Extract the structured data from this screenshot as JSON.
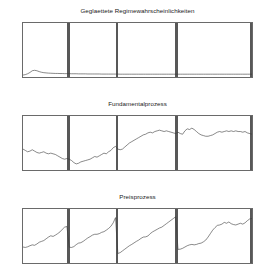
{
  "figure": {
    "background": "#ffffff",
    "line_color": "#3a3a3a",
    "axis_color": "#6a6a6a",
    "regime_bar_color": "#585858"
  },
  "panels": [
    {
      "name": "smoothed-regime-probabilities",
      "title": "Geglaettete Regimewahrscheinlichkeiten"
    },
    {
      "name": "fundamental-process",
      "title": "Fundamentalprozess"
    },
    {
      "name": "price-process",
      "title": "Preisprozess"
    }
  ],
  "chart_data": [
    {
      "type": "line",
      "title": "Geglaettete Regimewahrscheinlichkeiten",
      "xlabel": "",
      "ylabel": "",
      "xlim": [
        1,
        100
      ],
      "ylim": [
        0,
        0.5
      ],
      "grid": false,
      "legend": "none",
      "xticks": [
        5,
        10,
        15,
        20,
        25,
        30,
        35,
        40,
        45,
        50,
        55,
        60,
        65,
        70,
        75,
        80,
        85,
        90,
        95,
        100
      ],
      "xticklabels": [
        "5",
        "10",
        "15",
        "20",
        "25",
        "30",
        "35",
        "40",
        "45",
        "50",
        "55",
        "60",
        "65",
        "70",
        "75",
        "80",
        "85",
        "90",
        "95",
        "100"
      ],
      "yticks": [
        0,
        0.1,
        0.2,
        0.3,
        0.4,
        0.5
      ],
      "yticklabels": [
        "0",
        ".1",
        ".2",
        ".3",
        ".4",
        ".5"
      ],
      "annotations": [
        {
          "type": "vspan",
          "x0": 20.0,
          "x1": 21.2
        },
        {
          "type": "vspan",
          "x0": 41.0,
          "x1": 42.2
        },
        {
          "type": "vspan",
          "x0": 66.8,
          "x1": 68.0
        },
        {
          "type": "vspan",
          "x0": 99.0,
          "x1": 100.0
        }
      ],
      "x": [
        1,
        2,
        3,
        4,
        5,
        6,
        7,
        8,
        9,
        10,
        11,
        12,
        13,
        14,
        15,
        16,
        17,
        18,
        19,
        20,
        21,
        22,
        23,
        24,
        25,
        26,
        27,
        28,
        29,
        30,
        31,
        32,
        33,
        34,
        35,
        36,
        37,
        38,
        39,
        40,
        41,
        42,
        43,
        44,
        45,
        46,
        47,
        48,
        49,
        50,
        51,
        52,
        53,
        54,
        55,
        56,
        57,
        58,
        59,
        60,
        61,
        62,
        63,
        64,
        65,
        66,
        67,
        68,
        69,
        70,
        71,
        72,
        73,
        74,
        75,
        76,
        77,
        78,
        79,
        80,
        81,
        82,
        83,
        84,
        85,
        86,
        87,
        88,
        89,
        90,
        91,
        92,
        93,
        94,
        95,
        96,
        97,
        98,
        99,
        100
      ],
      "values": [
        0.018,
        0.022,
        0.03,
        0.042,
        0.058,
        0.062,
        0.058,
        0.05,
        0.044,
        0.04,
        0.038,
        0.036,
        0.035,
        0.034,
        0.033,
        0.033,
        0.032,
        0.032,
        0.031,
        0.031,
        0.031,
        0.03,
        0.03,
        0.03,
        0.029,
        0.029,
        0.029,
        0.029,
        0.028,
        0.028,
        0.028,
        0.028,
        0.028,
        0.028,
        0.027,
        0.027,
        0.027,
        0.027,
        0.027,
        0.027,
        0.027,
        0.027,
        0.026,
        0.026,
        0.026,
        0.026,
        0.026,
        0.026,
        0.026,
        0.026,
        0.026,
        0.026,
        0.026,
        0.026,
        0.026,
        0.026,
        0.026,
        0.026,
        0.026,
        0.026,
        0.026,
        0.026,
        0.026,
        0.026,
        0.026,
        0.026,
        0.026,
        0.026,
        0.026,
        0.026,
        0.026,
        0.026,
        0.026,
        0.026,
        0.026,
        0.026,
        0.026,
        0.026,
        0.026,
        0.026,
        0.026,
        0.026,
        0.026,
        0.026,
        0.026,
        0.026,
        0.026,
        0.026,
        0.026,
        0.026,
        0.026,
        0.026,
        0.026,
        0.026,
        0.026,
        0.026,
        0.026,
        0.026,
        0.026,
        0.026
      ]
    },
    {
      "type": "line",
      "title": "Fundamentalprozess",
      "xlabel": "",
      "ylabel": "",
      "xlim": [
        1,
        100
      ],
      "ylim": [
        0,
        80
      ],
      "grid": false,
      "legend": "none",
      "xticks": [
        5,
        10,
        15,
        20,
        25,
        30,
        35,
        40,
        45,
        50,
        55,
        60,
        65,
        70,
        75,
        80,
        85,
        90,
        95,
        100
      ],
      "xticklabels": [
        "5",
        "10",
        "15",
        "20",
        "25",
        "30",
        "35",
        "40",
        "45",
        "50",
        "55",
        "60",
        "65",
        "70",
        "75",
        "80",
        "85",
        "90",
        "95",
        "100"
      ],
      "yticks": [
        0,
        20,
        40,
        60,
        80
      ],
      "yticklabels": [
        "0",
        "20",
        "40",
        "60",
        "80"
      ],
      "annotations": [
        {
          "type": "vspan",
          "x0": 20.0,
          "x1": 21.2
        },
        {
          "type": "vspan",
          "x0": 41.0,
          "x1": 42.2
        },
        {
          "type": "vspan",
          "x0": 66.8,
          "x1": 68.0
        },
        {
          "type": "vspan",
          "x0": 99.0,
          "x1": 100.0
        }
      ],
      "x": [
        1,
        2,
        3,
        4,
        5,
        6,
        7,
        8,
        9,
        10,
        11,
        12,
        13,
        14,
        15,
        16,
        17,
        18,
        19,
        20,
        21,
        22,
        23,
        24,
        25,
        26,
        27,
        28,
        29,
        30,
        31,
        32,
        33,
        34,
        35,
        36,
        37,
        38,
        39,
        40,
        41,
        42,
        43,
        44,
        45,
        46,
        47,
        48,
        49,
        50,
        51,
        52,
        53,
        54,
        55,
        56,
        57,
        58,
        59,
        60,
        61,
        62,
        63,
        64,
        65,
        66,
        67,
        68,
        69,
        70,
        71,
        72,
        73,
        74,
        75,
        76,
        77,
        78,
        79,
        80,
        81,
        82,
        83,
        84,
        85,
        86,
        87,
        88,
        89,
        90,
        91,
        92,
        93,
        94,
        95,
        96,
        97,
        98,
        99,
        100
      ],
      "values": [
        31,
        29,
        27,
        28,
        30,
        28,
        26,
        25,
        26,
        27,
        25,
        24,
        25,
        24,
        23,
        21,
        19,
        17,
        16,
        17,
        16,
        14,
        11,
        9,
        10,
        12,
        13,
        14,
        15,
        16,
        18,
        20,
        19,
        21,
        23,
        25,
        24,
        27,
        29,
        33,
        35,
        31,
        30,
        31,
        34,
        37,
        40,
        42,
        44,
        46,
        48,
        50,
        52,
        53,
        55,
        56,
        55,
        57,
        58,
        59,
        58,
        57,
        58,
        57,
        56,
        55,
        54,
        56,
        54,
        53,
        58,
        61,
        60,
        62,
        60,
        57,
        54,
        52,
        51,
        50,
        50,
        51,
        52,
        54,
        56,
        57,
        56,
        57,
        58,
        57,
        58,
        57,
        58,
        57,
        57,
        56,
        57,
        55,
        54,
        53
      ]
    },
    {
      "type": "line",
      "title": "Preisprozess",
      "xlabel": "",
      "ylabel": "",
      "xlim": [
        1,
        100
      ],
      "ylim": [
        5,
        30
      ],
      "grid": false,
      "legend": "none",
      "xticks": [
        5,
        10,
        15,
        20,
        25,
        30,
        35,
        40,
        45,
        50,
        55,
        60,
        65,
        70,
        75,
        80,
        85,
        90,
        95,
        100
      ],
      "xticklabels": [
        "5",
        "10",
        "15",
        "20",
        "25",
        "30",
        "35",
        "40",
        "45",
        "50",
        "55",
        "60",
        "65",
        "70",
        "75",
        "80",
        "85",
        "90",
        "95",
        "100"
      ],
      "yticks": [
        5,
        10,
        15,
        20,
        25,
        30
      ],
      "yticklabels": [
        "5",
        "10",
        "15",
        "20",
        "25",
        "30"
      ],
      "annotations": [
        {
          "type": "vspan",
          "x0": 20.0,
          "x1": 21.2
        },
        {
          "type": "vspan",
          "x0": 41.0,
          "x1": 42.2
        },
        {
          "type": "vspan",
          "x0": 66.8,
          "x1": 68.0
        },
        {
          "type": "vspan",
          "x0": 99.0,
          "x1": 100.0
        }
      ],
      "x": [
        1,
        2,
        3,
        4,
        5,
        6,
        7,
        8,
        9,
        10,
        11,
        12,
        13,
        14,
        15,
        16,
        17,
        18,
        19,
        20,
        21,
        22,
        23,
        24,
        25,
        26,
        27,
        28,
        29,
        30,
        31,
        32,
        33,
        34,
        35,
        36,
        37,
        38,
        39,
        40,
        41,
        42,
        43,
        44,
        45,
        46,
        47,
        48,
        49,
        50,
        51,
        52,
        53,
        54,
        55,
        56,
        57,
        58,
        59,
        60,
        61,
        62,
        63,
        64,
        65,
        66,
        67,
        68,
        69,
        70,
        71,
        72,
        73,
        74,
        75,
        76,
        77,
        78,
        79,
        80,
        81,
        82,
        83,
        84,
        85,
        86,
        87,
        88,
        89,
        90,
        91,
        92,
        93,
        94,
        95,
        96,
        97,
        98,
        99,
        100
      ],
      "values": [
        12.4,
        12.2,
        12.5,
        13.0,
        13.4,
        13.2,
        13.8,
        14.6,
        15.0,
        15.4,
        16.2,
        17.0,
        17.6,
        17.3,
        17.9,
        18.6,
        19.4,
        20.6,
        21.6,
        21.9,
        12.3,
        12.2,
        12.6,
        13.5,
        14.2,
        14.4,
        15.0,
        15.8,
        16.6,
        17.2,
        17.9,
        18.3,
        18.3,
        18.6,
        19.2,
        19.5,
        20.2,
        21.0,
        22.0,
        23.6,
        26.0,
        9.4,
        9.8,
        10.6,
        11.4,
        12.2,
        13.0,
        13.6,
        14.3,
        15.0,
        15.6,
        16.4,
        17.0,
        17.1,
        17.5,
        18.6,
        19.4,
        20.0,
        20.6,
        21.2,
        21.6,
        22.4,
        23.2,
        24.0,
        24.8,
        25.6,
        26.4,
        11.3,
        11.4,
        11.8,
        12.4,
        13.0,
        13.4,
        13.6,
        13.4,
        13.6,
        14.0,
        14.2,
        14.8,
        15.6,
        17.0,
        18.6,
        20.2,
        21.4,
        22.4,
        22.6,
        23.0,
        23.8,
        23.4,
        24.0,
        23.2,
        22.8,
        22.6,
        23.0,
        23.4,
        23.0,
        23.6,
        24.6,
        25.4,
        25.6
      ]
    }
  ]
}
